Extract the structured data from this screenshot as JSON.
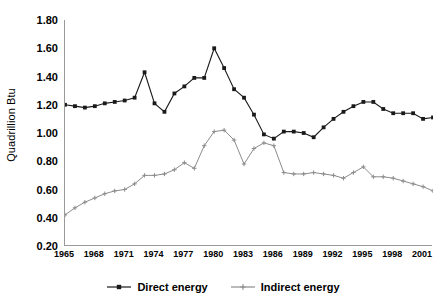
{
  "chart_data": {
    "type": "line",
    "title": "",
    "xlabel": "",
    "ylabel": "Quadrillion Btu",
    "ylim": [
      0.2,
      1.8
    ],
    "ytick_labels": [
      "1.80",
      "1.60",
      "1.40",
      "1.20",
      "1.00",
      "0.80",
      "0.60",
      "0.40",
      "0.20"
    ],
    "ytick_values": [
      1.8,
      1.6,
      1.4,
      1.2,
      1.0,
      0.8,
      0.6,
      0.4,
      0.2
    ],
    "xlim": [
      1965,
      2002
    ],
    "xtick_labels": [
      "1965",
      "1968",
      "1971",
      "1974",
      "1977",
      "1980",
      "1983",
      "1986",
      "1989",
      "1992",
      "1995",
      "1998",
      "2001"
    ],
    "xtick_values": [
      1965,
      1968,
      1971,
      1974,
      1977,
      1980,
      1983,
      1986,
      1989,
      1992,
      1995,
      1998,
      2001
    ],
    "grid": false,
    "legend_position": "bottom",
    "x": [
      1965,
      1966,
      1967,
      1968,
      1969,
      1970,
      1971,
      1972,
      1973,
      1974,
      1975,
      1976,
      1977,
      1978,
      1979,
      1980,
      1981,
      1982,
      1983,
      1984,
      1985,
      1986,
      1987,
      1988,
      1989,
      1990,
      1991,
      1992,
      1993,
      1994,
      1995,
      1996,
      1997,
      1998,
      1999,
      2000,
      2001,
      2002
    ],
    "series": [
      {
        "name": "Direct energy",
        "color": "#1a1a1a",
        "marker": "square",
        "values": [
          1.2,
          1.19,
          1.18,
          1.19,
          1.21,
          1.22,
          1.23,
          1.25,
          1.43,
          1.21,
          1.15,
          1.28,
          1.33,
          1.39,
          1.39,
          1.6,
          1.46,
          1.31,
          1.25,
          1.13,
          0.99,
          0.96,
          1.01,
          1.01,
          1.0,
          0.97,
          1.04,
          1.1,
          1.15,
          1.19,
          1.22,
          1.22,
          1.17,
          1.14,
          1.14,
          1.14,
          1.1,
          1.11
        ]
      },
      {
        "name": "Indirect energy",
        "color": "#8c8c8c",
        "marker": "plus",
        "values": [
          0.42,
          0.47,
          0.51,
          0.54,
          0.57,
          0.59,
          0.6,
          0.64,
          0.7,
          0.7,
          0.71,
          0.74,
          0.79,
          0.75,
          0.91,
          1.01,
          1.02,
          0.95,
          0.78,
          0.89,
          0.93,
          0.91,
          0.72,
          0.71,
          0.71,
          0.72,
          0.71,
          0.7,
          0.68,
          0.72,
          0.76,
          0.69,
          0.69,
          0.68,
          0.66,
          0.64,
          0.62,
          0.59
        ]
      }
    ]
  },
  "legend": {
    "entries": [
      {
        "label": "Direct energy"
      },
      {
        "label": "Indirect energy"
      }
    ]
  }
}
